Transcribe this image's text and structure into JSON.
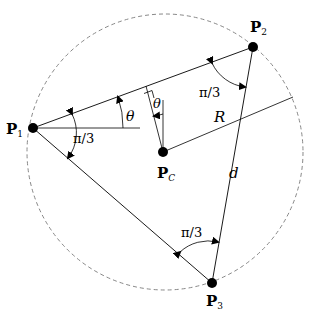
{
  "diagram": {
    "points": {
      "P1": {
        "label": "P",
        "sub": "1",
        "x": 33,
        "y": 128
      },
      "P2": {
        "label": "P",
        "sub": "2",
        "x": 253,
        "y": 47
      },
      "P3": {
        "label": "P",
        "sub": "3",
        "x": 212,
        "y": 283
      },
      "Pc": {
        "label": "P",
        "sub": "C",
        "x": 163,
        "y": 152
      }
    },
    "circle": {
      "cx": 165,
      "cy": 152,
      "r": 138,
      "style": "dashed"
    },
    "labels": {
      "theta_p1": "θ",
      "theta_c": "θ",
      "angle_p1": "π/3",
      "angle_p2": "π/3",
      "angle_p3": "π/3",
      "radius": "R",
      "side": "d"
    },
    "colors": {
      "line": "#000000",
      "circle": "#888888"
    }
  }
}
